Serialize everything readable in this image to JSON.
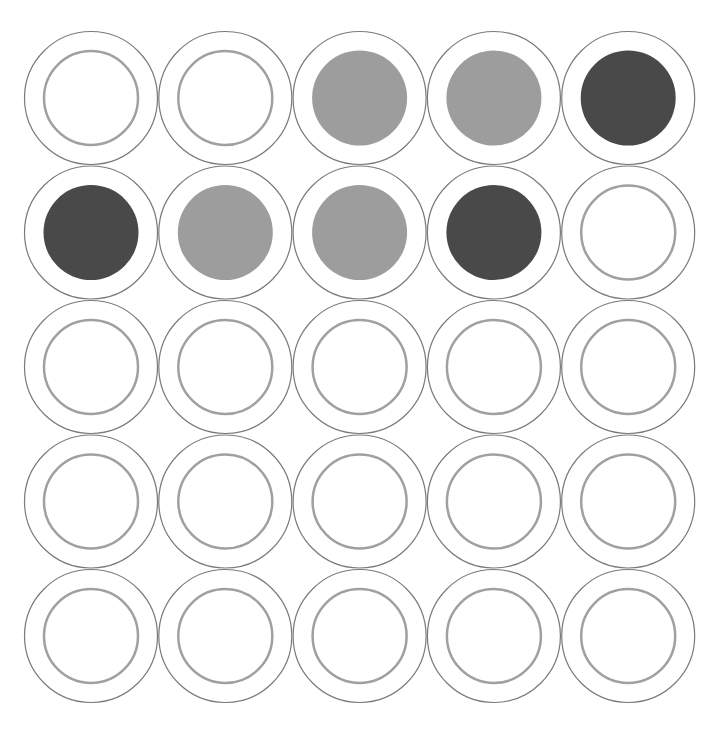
{
  "board": {
    "rows": 5,
    "cols": 5,
    "colors": {
      "empty_ring": "#a0a0a0",
      "outer_ring": "#7a7a7a",
      "light": "#9d9d9d",
      "dark": "#494949",
      "background": "#ffffff"
    },
    "cells": [
      [
        "empty",
        "empty",
        "light",
        "light",
        "dark"
      ],
      [
        "dark",
        "light",
        "light",
        "dark",
        "empty"
      ],
      [
        "empty",
        "empty",
        "empty",
        "empty",
        "empty"
      ],
      [
        "empty",
        "empty",
        "empty",
        "empty",
        "empty"
      ],
      [
        "empty",
        "empty",
        "empty",
        "empty",
        "empty"
      ]
    ]
  }
}
